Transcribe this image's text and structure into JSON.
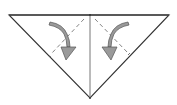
{
  "diagram": {
    "type": "origami-fold-step",
    "description": "Triangle with center crease; fold both upper flaps down along dashed valley lines",
    "colors": {
      "background": "#ffffff",
      "outline": "#333333",
      "crease": "#666666",
      "arrow_fill": "#9a9a9a",
      "arrow_stroke": "#555555"
    },
    "shapes": {
      "triangle": {
        "points": [
          [
            9,
            15
          ],
          [
            169,
            15
          ],
          [
            90,
            98
          ]
        ]
      },
      "center_crease": {
        "from": [
          90,
          15
        ],
        "to": [
          90,
          98
        ]
      },
      "fold_lines": [
        {
          "side": "left",
          "style": "dashed",
          "from": [
            84,
            19
          ],
          "to": [
            52,
            53
          ]
        },
        {
          "side": "right",
          "style": "dashed",
          "from": [
            95,
            19
          ],
          "to": [
            128,
            53
          ]
        }
      ],
      "arrows": [
        {
          "side": "left",
          "direction": "fold-down-inward",
          "start": [
            50,
            22
          ],
          "tip": [
            66,
            60
          ]
        },
        {
          "side": "right",
          "direction": "fold-down-inward",
          "start": [
            128,
            22
          ],
          "tip": [
            111,
            60
          ]
        }
      ]
    }
  }
}
